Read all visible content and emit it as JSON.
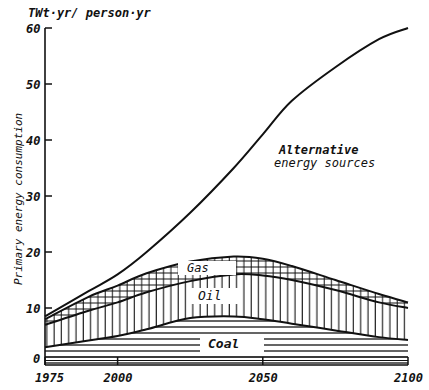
{
  "chart_data": {
    "type": "area",
    "title": "",
    "unit_label": "TWt·yr/ person·yr",
    "ylabel": "Primary energy consumption",
    "xlabel": "",
    "ylim": [
      0,
      60
    ],
    "xlim": [
      1975,
      2100
    ],
    "y_ticks": [
      0,
      10,
      20,
      30,
      40,
      50,
      60
    ],
    "x_ticks": [
      1975,
      2000,
      2050,
      2100
    ],
    "grid": false,
    "x": [
      1975,
      1990,
      2000,
      2010,
      2025,
      2040,
      2050,
      2060,
      2075,
      2090,
      2100
    ],
    "series": [
      {
        "name": "Coal",
        "pattern": "horizontal-lines",
        "values": [
          3,
          4.2,
          5,
          6.2,
          8.2,
          8.5,
          8,
          7.2,
          6,
          4.8,
          4.3
        ]
      },
      {
        "name": "Oil",
        "pattern": "vertical-lines",
        "values": [
          7,
          9.5,
          11,
          12.8,
          14.8,
          16,
          15.8,
          15,
          13.2,
          11,
          10
        ]
      },
      {
        "name": "Gas",
        "pattern": "crosshatch",
        "values": [
          8,
          12,
          14,
          16.2,
          18.3,
          19.2,
          18.8,
          17.5,
          15,
          12.5,
          11
        ]
      },
      {
        "name": "Alternative energy sources",
        "pattern": "none",
        "values": [
          8.5,
          13,
          16,
          20,
          27,
          35,
          41,
          47,
          53,
          58,
          60
        ]
      }
    ],
    "annotations": [
      "Gas",
      "Oil",
      "Coal",
      "Alternative energy sources"
    ]
  },
  "labels": {
    "unit": "TWt·yr/ person·yr",
    "yaxis": "Primary energy consumption",
    "gas": "Gas",
    "oil": "Oil",
    "coal": "Coal",
    "alt_line1": "Alternative",
    "alt_line2": "energy sources",
    "yticks": [
      "0",
      "10",
      "20",
      "30",
      "40",
      "50",
      "60"
    ],
    "xticks": [
      "1975",
      "2000",
      "2050",
      "2100"
    ]
  }
}
